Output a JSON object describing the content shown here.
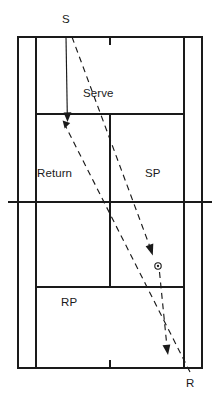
{
  "diagram": {
    "kind": "tennis-court-serve-return-diagram",
    "background_color": "#ffffff",
    "line_color": "#1a1a1a",
    "labels": {
      "server_point": "S",
      "receiver_point": "R",
      "serve_path": "Serve",
      "return_path": "Return",
      "server_partner_zone": "SP",
      "receiver_partner_zone": "RP"
    },
    "court": {
      "outer_left": 18,
      "outer_right": 202,
      "outer_top": 37,
      "outer_bottom": 368,
      "singles_left": 36,
      "singles_right": 184,
      "net_y": 202,
      "net_left": 8,
      "net_right": 212,
      "service_line_top_y": 114,
      "service_line_bottom_y": 287,
      "center_service_line_x": 110,
      "center_mark_top_y": 37,
      "center_mark_bottom_y": 368
    },
    "trajectories": [
      {
        "name": "server-approach",
        "style": "solid",
        "from": [
          66,
          37
        ],
        "to": [
          67,
          120
        ],
        "arrow": true
      },
      {
        "name": "serve",
        "style": "dashed",
        "from": [
          72,
          37
        ],
        "to": [
          152,
          253
        ],
        "arrow": true
      },
      {
        "name": "ball-bounce-to-receiver",
        "style": "dashed",
        "from": [
          159,
          267
        ],
        "to": [
          168,
          354
        ],
        "arrow": true
      },
      {
        "name": "return",
        "style": "dashed",
        "from": [
          190,
          372
        ],
        "to": [
          63,
          122
        ],
        "arrow": true
      }
    ],
    "ball_marker": {
      "x": 158,
      "y": 266,
      "radius": 3
    }
  }
}
